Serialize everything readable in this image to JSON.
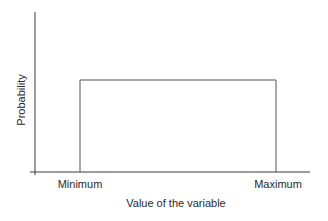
{
  "chart_data": {
    "type": "line",
    "title": "",
    "xlabel": "Value of the variable",
    "ylabel": "Probability",
    "x_ticks": [
      "Minimum",
      "Maximum"
    ],
    "series": [
      {
        "name": "Uniform distribution",
        "x": [
          "Minimum",
          "Minimum",
          "Maximum",
          "Maximum"
        ],
        "values": [
          0,
          1,
          1,
          0
        ]
      }
    ],
    "grid": false,
    "legend": null
  },
  "colors": {
    "axis": "#3a3a3a",
    "line": "#555555",
    "text": "#2a2a2a"
  },
  "geometry": {
    "y_axis_x": 35,
    "y_axis_top": 12,
    "y_axis_bottom": 175,
    "x_axis_y": 172,
    "x_axis_left": 30,
    "x_axis_right": 310,
    "rect_left": 80,
    "rect_right": 276,
    "rect_top": 80
  }
}
